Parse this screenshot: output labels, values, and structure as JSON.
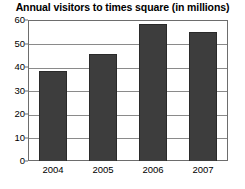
{
  "chart_data": {
    "type": "bar",
    "title": "Annual visitors to times square (in millions)",
    "xlabel": "",
    "ylabel": "",
    "categories": [
      "2004",
      "2005",
      "2006",
      "2007"
    ],
    "values": [
      38.5,
      45.5,
      58.5,
      55
    ],
    "ylim": [
      0,
      60
    ],
    "yticks": [
      0,
      10,
      20,
      30,
      40,
      50,
      60
    ],
    "ytick_labels": [
      "0",
      "10",
      "20",
      "30",
      "40",
      "50",
      "60"
    ],
    "grid": true,
    "legend": false,
    "bar_color": "#3d3d3d",
    "frame_color": "#6d6d6d",
    "gridline_color": "#8a8a8a",
    "background_color": "#ffffff",
    "text_color": "#000000"
  }
}
